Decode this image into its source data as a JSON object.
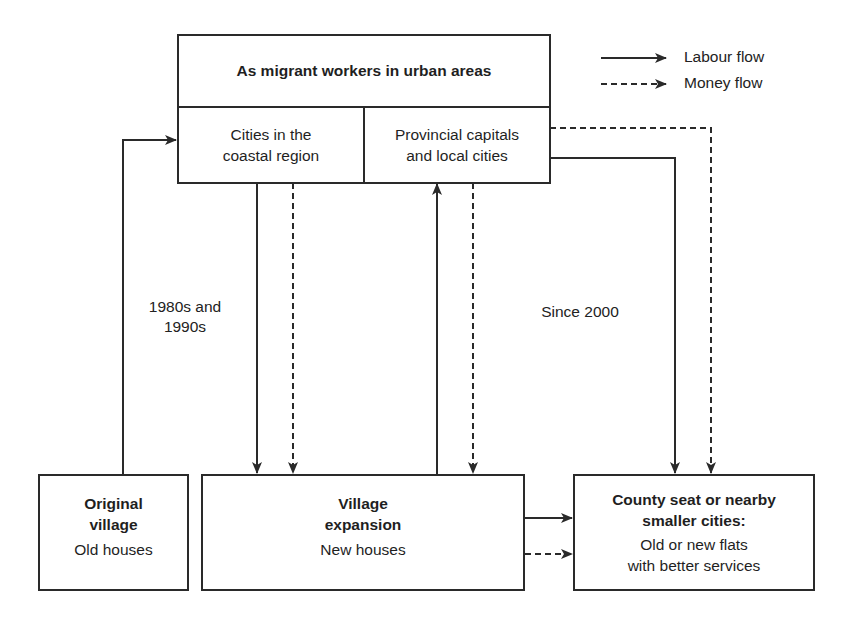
{
  "top_box": {
    "title": "As migrant workers in urban areas",
    "left_cell": [
      "Cities in the",
      "coastal region"
    ],
    "right_cell": [
      "Provincial capitals",
      "and local cities"
    ]
  },
  "legend": {
    "labour": "Labour flow",
    "money": "Money flow"
  },
  "labels": {
    "period_1": [
      "1980s and",
      "1990s"
    ],
    "period_2": "Since 2000"
  },
  "original_village": {
    "title": [
      "Original",
      "village"
    ],
    "subtitle": "Old houses"
  },
  "village_expansion": {
    "title": [
      "Village",
      "expansion"
    ],
    "subtitle": "New houses"
  },
  "county_seat": {
    "title": [
      "County seat or nearby",
      "smaller cities:"
    ],
    "subtitle": [
      "Old or new flats",
      "with better services"
    ]
  },
  "colors": {
    "line": "#2a2a2a",
    "text": "#222222"
  }
}
